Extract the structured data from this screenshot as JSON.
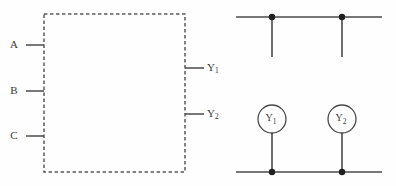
{
  "figure": {
    "background_color": "#fefefe",
    "line_color": "#4a4a4a",
    "node_color": "#1f1f1f",
    "text_color": "#3a3a3a"
  },
  "block": {
    "name": "dashed-logic-block",
    "style": "dashed rectangle",
    "x": 44,
    "y": 14,
    "width": 141,
    "height": 158,
    "inputs": [
      {
        "label": "A",
        "label_x": 16,
        "y": 45,
        "stub_from_x": 26,
        "stub_to_x": 44
      },
      {
        "label": "B",
        "label_x": 16,
        "y": 91,
        "stub_from_x": 26,
        "stub_to_x": 44
      },
      {
        "label": "C",
        "label_x": 16,
        "y": 136,
        "stub_from_x": 26,
        "stub_to_x": 44
      }
    ],
    "outputs": [
      {
        "label": "Y",
        "subscript": "1",
        "label_x": 208,
        "y": 68,
        "stub_from_x": 185,
        "stub_to_x": 204
      },
      {
        "label": "Y",
        "subscript": "2",
        "label_x": 208,
        "y": 114,
        "stub_from_x": 185,
        "stub_to_x": 204
      }
    ]
  },
  "lamp_circuit": {
    "name": "indicator-lamp-network",
    "top_rail": {
      "y": 17,
      "x1": 236,
      "x2": 382
    },
    "bottom_rail": {
      "y": 172,
      "x1": 236,
      "x2": 382
    },
    "branches": [
      {
        "x": 272,
        "lamp_label": "Y",
        "lamp_subscript": "1",
        "lamp_cy": 119,
        "lamp_r": 14,
        "top_stub_y1": 17,
        "top_stub_y2": 57,
        "bottom_stub_y1": 133,
        "bottom_stub_y2": 172
      },
      {
        "x": 342,
        "lamp_label": "Y",
        "lamp_subscript": "2",
        "lamp_cy": 119,
        "lamp_r": 14,
        "top_stub_y1": 17,
        "top_stub_y2": 57,
        "bottom_stub_y1": 133,
        "bottom_stub_y2": 172
      }
    ],
    "junction_nodes": [
      {
        "x": 272,
        "y": 17,
        "r": 3.2
      },
      {
        "x": 342,
        "y": 17,
        "r": 3.2
      },
      {
        "x": 272,
        "y": 172,
        "r": 3.2
      },
      {
        "x": 342,
        "y": 172,
        "r": 3.2
      }
    ]
  }
}
